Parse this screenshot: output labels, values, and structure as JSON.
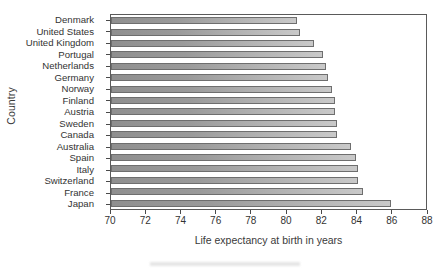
{
  "chart_data": {
    "type": "bar",
    "orientation": "horizontal",
    "title": "",
    "xlabel": "Life expectancy at birth in years",
    "ylabel": "Country",
    "xlim": [
      70,
      88
    ],
    "ylim": null,
    "grid": false,
    "legend": null,
    "xticks": [
      70,
      72,
      74,
      76,
      78,
      80,
      82,
      84,
      86,
      88
    ],
    "xtick_labels": [
      "70",
      "72",
      "74",
      "76",
      "78",
      "80",
      "82",
      "84",
      "86",
      "88"
    ],
    "categories": [
      "Denmark",
      "United States",
      "United Kingdom",
      "Portugal",
      "Netherlands",
      "Germany",
      "Norway",
      "Finland",
      "Austria",
      "Sweden",
      "Canada",
      "Australia",
      "Spain",
      "Italy",
      "Switzerland",
      "France",
      "Japan"
    ],
    "values": [
      80.6,
      80.8,
      81.6,
      82.1,
      82.3,
      82.4,
      82.6,
      82.8,
      82.8,
      82.9,
      82.9,
      83.7,
      84.0,
      84.1,
      84.1,
      84.4,
      86.0
    ],
    "bar_color_left": "#8f8f8f",
    "bar_color_right": "#c9c9c9",
    "bar_edge_color": "#6e6e6e",
    "axis_color": "#5a5a5a",
    "background_color": "#ffffff"
  }
}
